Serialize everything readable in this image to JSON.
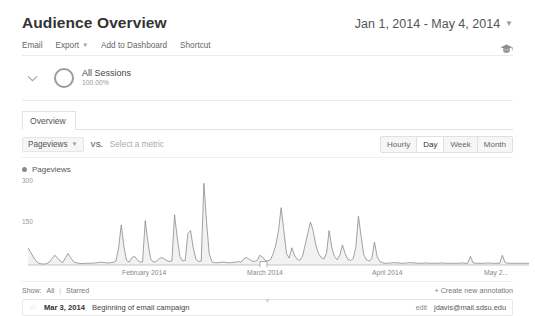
{
  "header": {
    "title": "Audience Overview",
    "date_range": "Jan 1, 2014 - May 4, 2014",
    "caret_icon": "chevron-down-icon"
  },
  "toolbar": {
    "email": "Email",
    "export": "Export",
    "add_to_dashboard": "Add to Dashboard",
    "shortcut": "Shortcut",
    "help_icon": "graduation-cap-icon"
  },
  "segment": {
    "toggle_icon": "chevron-down-icon",
    "segment_icon": "donut-segment-icon",
    "name": "All Sessions",
    "percent": "100.00%"
  },
  "tabs": [
    {
      "label": "Overview",
      "active": true
    }
  ],
  "metric_row": {
    "primary_metric": "Pageviews",
    "caret_icon": "chevron-down-icon",
    "vs_label": "VS.",
    "secondary_placeholder": "Select a metric",
    "granularity": [
      {
        "label": "Hourly",
        "active": false
      },
      {
        "label": "Day",
        "active": true
      },
      {
        "label": "Week",
        "active": false
      },
      {
        "label": "Month",
        "active": false
      }
    ]
  },
  "chart_data": {
    "type": "line",
    "title": "Pageviews",
    "legend": [
      "Pageviews"
    ],
    "legend_position": "top-left",
    "xlabel": "",
    "ylabel": "Pageviews",
    "ylim": [
      0,
      300
    ],
    "yticks": [
      150,
      300
    ],
    "ytick_labels": [
      "150",
      "300"
    ],
    "grid": false,
    "xtick_labels": [
      "February 2014",
      "March 2014",
      "April 2014",
      "May 2..."
    ],
    "xtick_positions": [
      0.255,
      0.505,
      0.755,
      0.975
    ],
    "x_start": "Jan 1, 2014",
    "x_end": "May 4, 2014",
    "line_color": "#8a8a8a",
    "fill_color": "#f4f4f4",
    "annotation_marker_x": 0.47,
    "values": [
      60,
      44,
      28,
      14,
      6,
      4,
      3,
      5,
      10,
      22,
      34,
      26,
      14,
      8,
      24,
      40,
      26,
      12,
      8,
      6,
      5,
      5,
      6,
      6,
      6,
      7,
      8,
      10,
      9,
      8,
      7,
      8,
      9,
      14,
      60,
      140,
      62,
      16,
      10,
      26,
      30,
      18,
      10,
      12,
      155,
      80,
      22,
      10,
      12,
      20,
      26,
      22,
      16,
      12,
      14,
      175,
      95,
      30,
      14,
      16,
      110,
      120,
      60,
      20,
      12,
      14,
      285,
      150,
      40,
      12,
      8,
      8,
      9,
      10,
      9,
      8,
      8,
      9,
      10,
      12,
      10,
      22,
      26,
      20,
      14,
      12,
      16,
      34,
      28,
      16,
      14,
      18,
      40,
      70,
      120,
      200,
      120,
      40,
      24,
      60,
      34,
      20,
      16,
      30,
      70,
      110,
      150,
      120,
      70,
      40,
      26,
      20,
      40,
      120,
      60,
      30,
      18,
      34,
      70,
      40,
      20,
      16,
      22,
      60,
      170,
      100,
      36,
      18,
      14,
      22,
      80,
      30,
      12,
      8,
      6,
      6,
      7,
      8,
      8,
      7,
      6,
      6,
      7,
      8,
      8,
      7,
      6,
      6,
      6,
      7,
      7,
      6,
      6,
      6,
      6,
      7,
      7,
      6,
      6,
      6,
      6,
      6,
      7,
      7,
      6,
      6,
      30,
      8,
      6,
      6,
      6,
      6,
      7,
      7,
      6,
      6,
      6,
      6,
      34,
      9,
      6,
      6,
      6,
      6,
      6,
      6,
      6,
      6,
      6
    ]
  },
  "annotations": {
    "show_label": "Show:",
    "filter_all": "All",
    "filter_starred": "Starred",
    "create_link": "+ Create new annotation",
    "rows": [
      {
        "star_icon": "star-icon",
        "date": "Mar 3, 2014",
        "text": "Beginning of email campaign",
        "edit_label": "edit",
        "owner": "jdavis@mail.sdsu.edu"
      }
    ]
  },
  "footer": {
    "collapse_icon": "chevron-down-icon"
  }
}
